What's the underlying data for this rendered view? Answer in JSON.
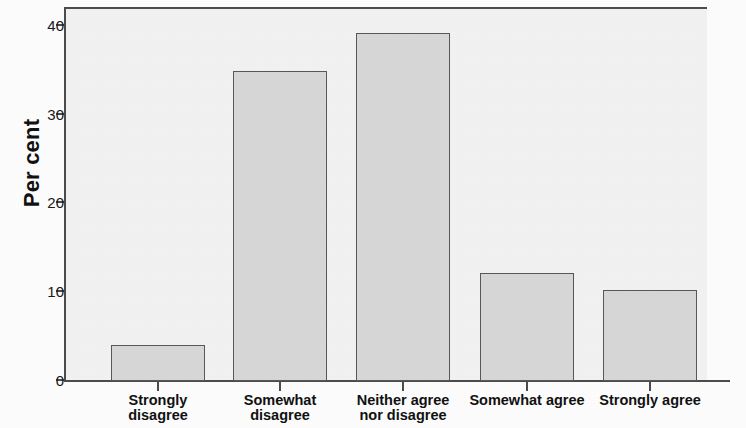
{
  "chart_data": {
    "type": "bar",
    "title": "",
    "subtitle": "",
    "xlabel": "",
    "ylabel": "Per cent",
    "categories": [
      "Strongly disagree",
      "Somewhat disagree",
      "Neither agree nor disagree",
      "Somewhat agree",
      "Strongly agree"
    ],
    "category_lines": [
      [
        "Strongly",
        "disagree"
      ],
      [
        "Somewhat",
        "disagree"
      ],
      [
        "Neither agree",
        "nor disagree"
      ],
      [
        "Somewhat agree",
        ""
      ],
      [
        "Strongly agree",
        ""
      ]
    ],
    "values": [
      4.0,
      34.9,
      39.2,
      12.2,
      10.2
    ],
    "ylim": [
      0,
      42
    ],
    "yticks": [
      0,
      10,
      20,
      30,
      40
    ],
    "ytick_labels": [
      "0",
      "10",
      "20",
      "30",
      "40"
    ],
    "grid": false,
    "legend": false,
    "legend_position": "none",
    "bar_fill_color": "#d9d9d9",
    "bar_edge_color": "#595959",
    "plot_background_color": "#f4f4f4",
    "axis_color": "#4d4d4d",
    "figure_background_color": "#ffffff"
  },
  "axis": {
    "y_title": "Per cent"
  }
}
